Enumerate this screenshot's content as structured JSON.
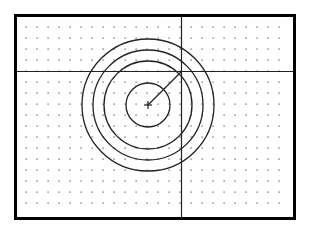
{
  "diagram": {
    "title": "",
    "colors": {
      "background": "#ffffff",
      "frame": "#000000",
      "grid_dot": "#555555",
      "geometry": "#222222",
      "crosshair": "#222222"
    },
    "grid": {
      "enabled": true,
      "style": "dots",
      "columns": 25,
      "rows": 18
    },
    "circles": [
      {
        "name": "circle-1",
        "radius_units": 2
      },
      {
        "name": "circle-2",
        "radius_units": 4
      },
      {
        "name": "circle-3",
        "radius_units": 5
      },
      {
        "name": "circle-4",
        "radius_units": 6
      }
    ],
    "center_marker": {
      "shape": "plus"
    },
    "radius_line": {
      "dx_units": 3,
      "dy_units": -3
    },
    "crosshair": {
      "visible": true
    }
  }
}
